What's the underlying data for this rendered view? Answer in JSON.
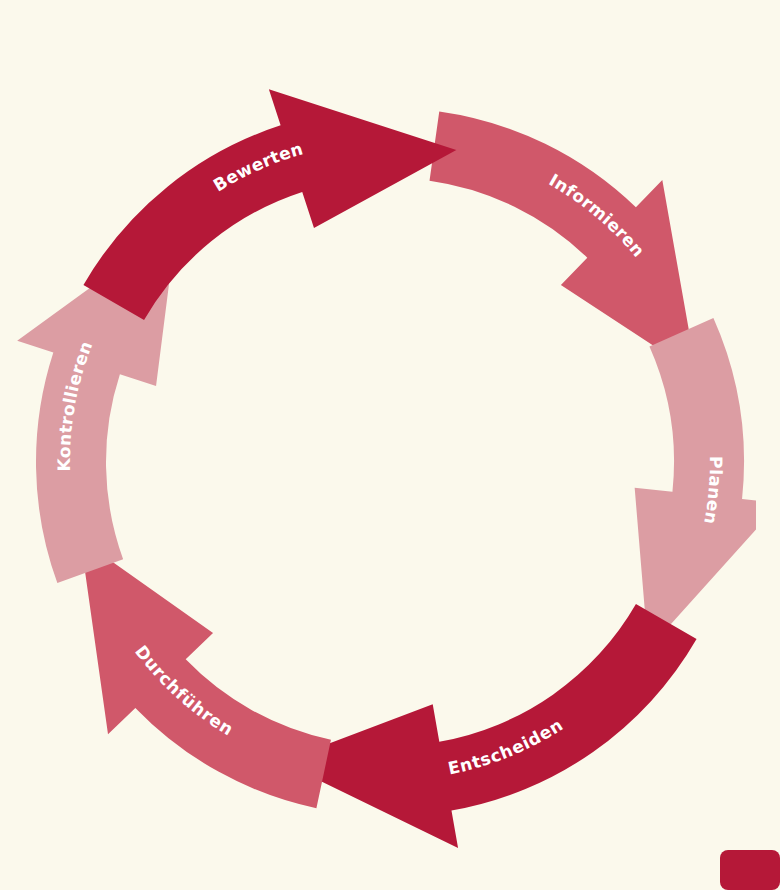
{
  "diagram": {
    "type": "cycle",
    "direction": "clockwise",
    "center": [
      390,
      462
    ],
    "outer_radius": 354,
    "inner_radius": 284,
    "colors": {
      "background": "#fbf9ec",
      "dark": "#b51838",
      "medium": "#d0586a",
      "light": "#dc9da3",
      "text": "#ffffff"
    },
    "segments": [
      {
        "label": "Bewerten",
        "color": "#b51838",
        "start_deg": 300,
        "tip_deg": 372,
        "label_deg": 336,
        "order": 6
      },
      {
        "label": "Informieren",
        "color": "#d0586a",
        "start_deg": 8,
        "tip_deg": 74,
        "label_deg": 40,
        "order": 1
      },
      {
        "label": "Planen",
        "color": "#dc9da3",
        "start_deg": 66,
        "tip_deg": 126,
        "label_deg": 95,
        "order": 2
      },
      {
        "label": "Entscheiden",
        "color": "#b51838",
        "start_deg": 120,
        "tip_deg": 200,
        "label_deg": 158,
        "order": 3
      },
      {
        "label": "Durchführen",
        "color": "#d0586a",
        "start_deg": 192,
        "tip_deg": 256,
        "label_deg": 222,
        "order": 4
      },
      {
        "label": "Kontrollieren",
        "color": "#dc9da3",
        "start_deg": 250,
        "tip_deg": 318,
        "label_deg": 280,
        "order": 5
      }
    ]
  },
  "corner_tab": {
    "color": "#b51838"
  }
}
